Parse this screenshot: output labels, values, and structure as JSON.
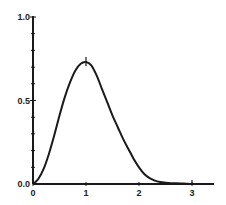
{
  "chart_data": {
    "type": "line",
    "title": "",
    "xlabel": "",
    "ylabel": "",
    "xlim": [
      0,
      3.4
    ],
    "ylim": [
      0,
      1.0
    ],
    "grid": false,
    "legend": null,
    "x_ticks": [
      "0",
      "1",
      "2",
      "3"
    ],
    "y_ticks": [
      "0.0",
      "0.5",
      "1.0"
    ],
    "series": [
      {
        "name": "curve",
        "x": [
          0,
          0.1,
          0.2,
          0.3,
          0.4,
          0.5,
          0.6,
          0.7,
          0.8,
          0.9,
          1.0,
          1.1,
          1.2,
          1.3,
          1.4,
          1.5,
          1.6,
          1.7,
          1.8,
          1.9,
          2.0,
          2.1,
          2.2,
          2.3,
          2.4,
          2.5,
          2.6,
          2.7,
          2.8,
          2.9,
          3.0
        ],
        "values": [
          0.0,
          0.03,
          0.09,
          0.18,
          0.29,
          0.41,
          0.52,
          0.61,
          0.68,
          0.72,
          0.73,
          0.71,
          0.65,
          0.57,
          0.49,
          0.41,
          0.34,
          0.27,
          0.21,
          0.15,
          0.1,
          0.06,
          0.035,
          0.02,
          0.012,
          0.008,
          0.005,
          0.004,
          0.003,
          0.002,
          0.0
        ]
      }
    ],
    "annotations": [
      {
        "type": "tick-mark",
        "x": 1.0,
        "y": 0.73,
        "text": "peak"
      }
    ]
  }
}
